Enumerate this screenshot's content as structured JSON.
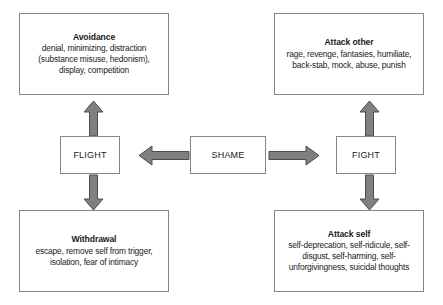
{
  "diagram": {
    "type": "flowchart",
    "colors": {
      "box_border": "#868686",
      "box_fill": "#ffffff",
      "arrow_fill": "#808080",
      "arrow_stroke": "#4d4d4d",
      "text": "#1a1a1a",
      "background": "#ffffff"
    },
    "nodes": {
      "shame": {
        "label": "SHAME"
      },
      "flight": {
        "label": "FLIGHT"
      },
      "fight": {
        "label": "FIGHT"
      },
      "avoidance": {
        "title": "Avoidance",
        "body": "denial, minimizing, distraction (substance misuse, hedonism), display, competition"
      },
      "withdrawal": {
        "title": "Withdrawal",
        "body": "escape, remove self from trigger, isolation, fear of intimacy"
      },
      "attack_other": {
        "title": "Attack other",
        "body": "rage, revenge, fantasies, humiliate, back-stab, mock, abuse, punish"
      },
      "attack_self": {
        "title": "Attack self",
        "body": "self-deprecation, self-ridicule, self-disgust, self-harming, self-unforgivingness, suicidal thoughts"
      }
    },
    "arrows": [
      {
        "name": "shame-to-flight",
        "from": "shame",
        "to": "flight",
        "direction": "left"
      },
      {
        "name": "shame-to-fight",
        "from": "shame",
        "to": "fight",
        "direction": "right"
      },
      {
        "name": "flight-to-avoidance",
        "from": "flight",
        "to": "avoidance",
        "direction": "up"
      },
      {
        "name": "flight-to-withdrawal",
        "from": "flight",
        "to": "withdrawal",
        "direction": "down"
      },
      {
        "name": "fight-to-attack-other",
        "from": "fight",
        "to": "attack_other",
        "direction": "up"
      },
      {
        "name": "fight-to-attack-self",
        "from": "fight",
        "to": "attack_self",
        "direction": "down"
      }
    ]
  }
}
